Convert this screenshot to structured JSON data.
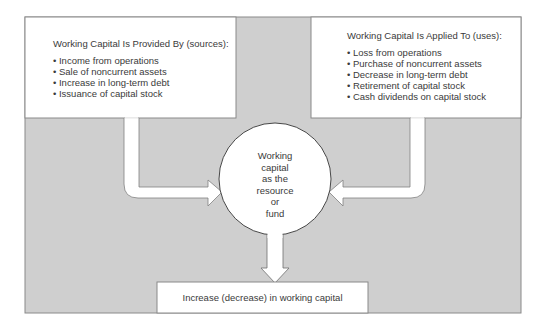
{
  "colors": {
    "panel": "#cfcfcf",
    "stroke": "#777777",
    "box": "#ffffff"
  },
  "sources": {
    "title": "Working Capital Is Provided By (sources):",
    "items": [
      "Income from operations",
      "Sale of noncurrent assets",
      "Increase in long-term debt",
      "Issuance of capital stock"
    ]
  },
  "uses": {
    "title": "Working Capital Is Applied To (uses):",
    "items": [
      "Loss from operations",
      "Purchase of noncurrent assets",
      "Decrease in long-term debt",
      "Retirement of capital stock",
      "Cash dividends on capital stock"
    ]
  },
  "center": {
    "lines": [
      "Working",
      "capital",
      "as the",
      "resource",
      "or",
      "fund"
    ]
  },
  "result": {
    "label": "Increase (decrease) in working capital"
  }
}
